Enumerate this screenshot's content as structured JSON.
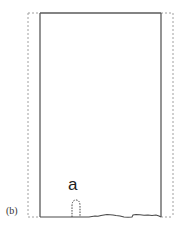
{
  "figure": {
    "panel_label": "(b)",
    "feature_label": "a",
    "colors": {
      "solid_line": "#555555",
      "dashed_line": "#999999",
      "background": "#ffffff"
    },
    "outer_dashed_rect": {
      "x1": 28,
      "y1": 13,
      "x2": 173,
      "y2": 217
    },
    "inner_solid_rect": {
      "x1": 40,
      "y1": 13,
      "x2": 161,
      "y2": 217
    }
  }
}
